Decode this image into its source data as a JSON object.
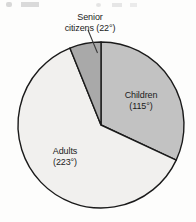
{
  "chart_data": {
    "type": "pie",
    "title": "",
    "subtitle": "",
    "xlabel": "",
    "ylabel": "",
    "units": "degrees",
    "total_degrees": 360,
    "legend_position": "none",
    "grid": false,
    "start_angle_deg": 0,
    "direction": "clockwise",
    "categories": [
      "Children",
      "Adults",
      "Senior citizens"
    ],
    "values": [
      115,
      223,
      22
    ],
    "slices": [
      {
        "name": "Children",
        "label_line1": "Children",
        "label_line2": "(115°)",
        "degrees": 115,
        "value_text": "115°",
        "color": "#c2c2c2",
        "start_deg": 0,
        "end_deg": 115,
        "has_leader_line": false
      },
      {
        "name": "Adults",
        "label_line1": "Adults",
        "label_line2": "(223°)",
        "degrees": 223,
        "value_text": "223°",
        "color": "#f1f0ee",
        "start_deg": 115,
        "end_deg": 338,
        "has_leader_line": false
      },
      {
        "name": "Senior citizens",
        "label_line1": "Senior",
        "label_line2": "citizens (22°)",
        "degrees": 22,
        "value_text": "22°",
        "color": "#a9a9a9",
        "start_deg": 338,
        "end_deg": 360,
        "has_leader_line": true
      }
    ],
    "geometry": {
      "center_x": 101,
      "center_y": 125,
      "radius": 83
    },
    "style": {
      "outline_color": "#1a1a1a",
      "background": "#fdfdfc",
      "label_color": "#1b1b1b"
    }
  }
}
